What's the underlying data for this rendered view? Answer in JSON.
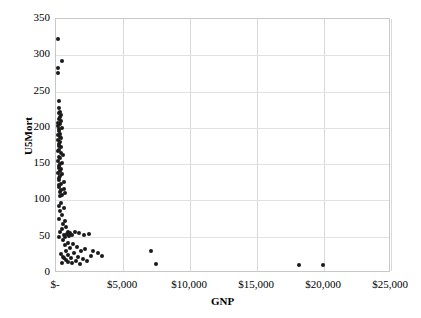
{
  "chart_data": {
    "type": "scatter",
    "title": "",
    "xlabel": "GNP",
    "ylabel": "U5Mort",
    "xlim": [
      0,
      25000
    ],
    "ylim": [
      0,
      350
    ],
    "grid": true,
    "legend": null,
    "xticks": [
      {
        "value": 0,
        "label": "$-"
      },
      {
        "value": 5000,
        "label": "$5,000"
      },
      {
        "value": 10000,
        "label": "$10,000"
      },
      {
        "value": 15000,
        "label": "$15,000"
      },
      {
        "value": 20000,
        "label": "$20,000"
      },
      {
        "value": 25000,
        "label": "$25,000"
      }
    ],
    "yticks": [
      {
        "value": 0,
        "label": "0"
      },
      {
        "value": 50,
        "label": "50"
      },
      {
        "value": 100,
        "label": "100"
      },
      {
        "value": 150,
        "label": "150"
      },
      {
        "value": 200,
        "label": "200"
      },
      {
        "value": 250,
        "label": "250"
      },
      {
        "value": 300,
        "label": "300"
      },
      {
        "value": 350,
        "label": "350"
      }
    ],
    "marker": {
      "shape": "circle",
      "color": "#1a1a1a",
      "size": 4
    },
    "series": [
      {
        "name": "Countries",
        "points": [
          [
            160,
            322
          ],
          [
            430,
            292
          ],
          [
            120,
            282
          ],
          [
            130,
            275
          ],
          [
            210,
            237
          ],
          [
            250,
            227
          ],
          [
            300,
            222
          ],
          [
            190,
            220
          ],
          [
            340,
            218
          ],
          [
            270,
            215
          ],
          [
            230,
            212
          ],
          [
            390,
            210
          ],
          [
            180,
            207
          ],
          [
            300,
            205
          ],
          [
            150,
            203
          ],
          [
            420,
            200
          ],
          [
            260,
            198
          ],
          [
            200,
            195
          ],
          [
            330,
            192
          ],
          [
            170,
            190
          ],
          [
            280,
            188
          ],
          [
            360,
            186
          ],
          [
            140,
            183
          ],
          [
            310,
            180
          ],
          [
            230,
            178
          ],
          [
            190,
            175
          ],
          [
            400,
            173
          ],
          [
            250,
            170
          ],
          [
            160,
            168
          ],
          [
            350,
            165
          ],
          [
            540,
            163
          ],
          [
            210,
            160
          ],
          [
            290,
            158
          ],
          [
            180,
            155
          ],
          [
            440,
            152
          ],
          [
            320,
            150
          ],
          [
            240,
            148
          ],
          [
            200,
            145
          ],
          [
            380,
            143
          ],
          [
            270,
            140
          ],
          [
            170,
            138
          ],
          [
            480,
            136
          ],
          [
            300,
            133
          ],
          [
            220,
            131
          ],
          [
            190,
            128
          ],
          [
            560,
            126
          ],
          [
            340,
            123
          ],
          [
            250,
            121
          ],
          [
            210,
            118
          ],
          [
            620,
            116
          ],
          [
            410,
            114
          ],
          [
            290,
            112
          ],
          [
            700,
            110
          ],
          [
            480,
            108
          ],
          [
            330,
            106
          ],
          [
            380,
            97
          ],
          [
            250,
            93
          ],
          [
            590,
            90
          ],
          [
            300,
            85
          ],
          [
            420,
            80
          ],
          [
            260,
            75
          ],
          [
            680,
            72
          ],
          [
            520,
            68
          ],
          [
            760,
            64
          ],
          [
            440,
            60
          ],
          [
            330,
            57
          ],
          [
            900,
            56
          ],
          [
            1050,
            55
          ],
          [
            820,
            54
          ],
          [
            620,
            53
          ],
          [
            1180,
            52
          ],
          [
            960,
            51
          ],
          [
            700,
            50
          ],
          [
            190,
            49
          ],
          [
            1400,
            57
          ],
          [
            1750,
            55
          ],
          [
            2100,
            52
          ],
          [
            2450,
            54
          ],
          [
            540,
            45
          ],
          [
            860,
            42
          ],
          [
            1250,
            40
          ],
          [
            680,
            38
          ],
          [
            1580,
            36
          ],
          [
            1020,
            34
          ],
          [
            2200,
            33
          ],
          [
            780,
            31
          ],
          [
            1900,
            30
          ],
          [
            2750,
            31
          ],
          [
            3100,
            28
          ],
          [
            1350,
            27
          ],
          [
            920,
            25
          ],
          [
            3450,
            24
          ],
          [
            2600,
            23
          ],
          [
            1650,
            22
          ],
          [
            600,
            21
          ],
          [
            1100,
            20
          ],
          [
            2050,
            19
          ],
          [
            760,
            18
          ],
          [
            1480,
            17
          ],
          [
            2350,
            16
          ],
          [
            890,
            15
          ],
          [
            1200,
            14
          ],
          [
            1800,
            13
          ],
          [
            520,
            22
          ],
          [
            380,
            26
          ],
          [
            440,
            14
          ],
          [
            7100,
            30
          ],
          [
            7450,
            12
          ],
          [
            18100,
            11
          ],
          [
            19900,
            11
          ]
        ]
      }
    ]
  }
}
